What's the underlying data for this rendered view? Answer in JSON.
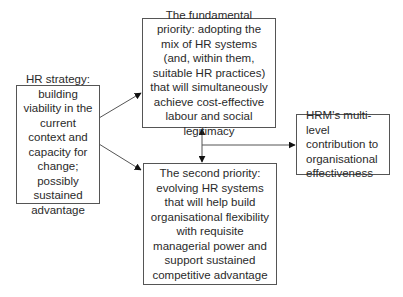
{
  "diagram": {
    "boxes": {
      "strategy": {
        "text": "HR strategy: building viability in the current context and capacity for change; possibly sustained advantage"
      },
      "fundamental": {
        "text": "The fundamental priority: adopting the mix of HR systems (and, within them, suitable HR practices) that will simultaneously achieve cost-effective labour and social legitimacy"
      },
      "second": {
        "text": "The second priority: evolving HR systems that will help build organisational flexibility with requisite managerial power and support sustained competitive advantage"
      },
      "outcome": {
        "text": "HRM's multi-level contribution to organisational effectiveness"
      }
    },
    "edges": [
      {
        "from": "strategy",
        "to": "fundamental"
      },
      {
        "from": "strategy",
        "to": "second"
      },
      {
        "from": "fundamental",
        "to": "second",
        "bidirectional": true
      },
      {
        "from": "fundamental-second-link",
        "to": "outcome"
      }
    ],
    "colors": {
      "line": "#555555",
      "arrow": "#111111",
      "text": "#2a2a2a"
    }
  }
}
